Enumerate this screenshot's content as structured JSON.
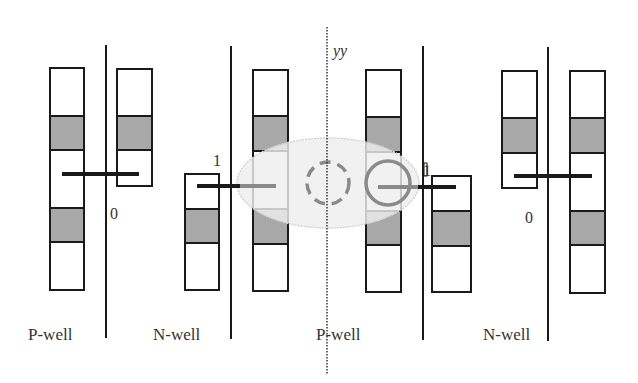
{
  "diagram": {
    "type": "well-layout-schematic",
    "colors": {
      "stroke": "#1a1a1a",
      "shade": "#a8a8a8",
      "ellipse_fill": "#ececec",
      "ellipse_stroke": "#d6d6d6",
      "circle_stroke": "#8a8a8a",
      "background": "#ffffff"
    },
    "center_axis_label": "yy",
    "well_labels": [
      "P-well",
      "N-well",
      "P-well",
      "N-well"
    ],
    "node_labels": {
      "left_zero": "0",
      "left_one": "1",
      "right_one": "1",
      "right_zero": "0"
    },
    "markers": {
      "dashed_circle": "dashed-circle-left-of-axis",
      "solid_circle": "solid-circle-right-of-axis"
    }
  }
}
